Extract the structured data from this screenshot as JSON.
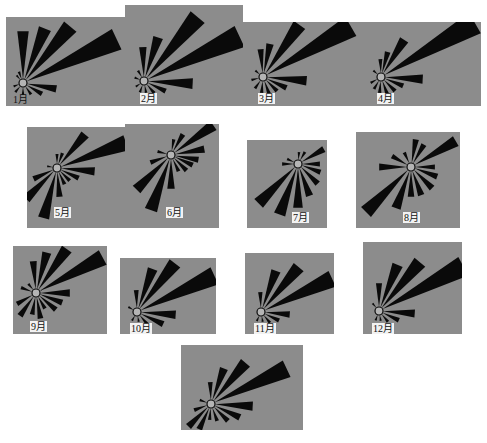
{
  "chart_data": {
    "type": "rose",
    "title": "",
    "panels": [
      {
        "label": "1月",
        "box": [
          6,
          17,
          119,
          89
        ],
        "hub": [
          23,
          83
        ],
        "label_pos": [
          12,
          94
        ],
        "label_box": false,
        "wedges": [
          [
            90,
            48
          ],
          [
            68,
            55
          ],
          [
            50,
            70
          ],
          [
            25,
            100
          ],
          [
            350,
            30
          ],
          [
            330,
            18
          ],
          [
            305,
            10
          ],
          [
            270,
            8
          ],
          [
            230,
            8
          ],
          [
            200,
            6
          ],
          [
            130,
            6
          ],
          [
            110,
            8
          ]
        ]
      },
      {
        "label": "2月",
        "box": [
          125,
          5,
          118,
          101
        ],
        "hub": [
          144,
          81
        ],
        "label_pos": [
          140,
          93
        ],
        "label_box": true,
        "wedges": [
          [
            92,
            30
          ],
          [
            72,
            42
          ],
          [
            50,
            80
          ],
          [
            25,
            102
          ],
          [
            357,
            45
          ],
          [
            335,
            20
          ],
          [
            310,
            12
          ],
          [
            280,
            8
          ],
          [
            250,
            8
          ],
          [
            215,
            6
          ],
          [
            160,
            6
          ],
          [
            120,
            8
          ]
        ]
      },
      {
        "label": "3月",
        "box": [
          243,
          22,
          123,
          84
        ],
        "hub": [
          263,
          77
        ],
        "label_pos": [
          258,
          93
        ],
        "label_box": true,
        "wedges": [
          [
            95,
            24
          ],
          [
            78,
            30
          ],
          [
            55,
            60
          ],
          [
            30,
            98
          ],
          [
            355,
            40
          ],
          [
            335,
            22
          ],
          [
            315,
            16
          ],
          [
            290,
            14
          ],
          [
            265,
            12
          ],
          [
            235,
            10
          ],
          [
            195,
            8
          ],
          [
            140,
            6
          ]
        ]
      },
      {
        "label": "4月",
        "box": [
          366,
          22,
          115,
          84
        ],
        "hub": [
          381,
          77
        ],
        "label_pos": [
          377,
          93
        ],
        "label_box": true,
        "wedges": [
          [
            92,
            14
          ],
          [
            75,
            22
          ],
          [
            58,
            40
          ],
          [
            30,
            105
          ],
          [
            357,
            38
          ],
          [
            338,
            20
          ],
          [
            315,
            16
          ],
          [
            290,
            14
          ],
          [
            265,
            12
          ],
          [
            240,
            10
          ],
          [
            210,
            8
          ],
          [
            140,
            6
          ]
        ]
      },
      {
        "label": "5月",
        "box": [
          27,
          127,
          98,
          101
        ],
        "hub": [
          57,
          168
        ],
        "label_pos": [
          54,
          207
        ],
        "label_box": true,
        "wedges": [
          [
            90,
            10
          ],
          [
            70,
            12
          ],
          [
            50,
            40
          ],
          [
            20,
            70
          ],
          [
            355,
            34
          ],
          [
            335,
            20
          ],
          [
            315,
            14
          ],
          [
            295,
            14
          ],
          [
            275,
            25
          ],
          [
            255,
            48
          ],
          [
            225,
            40
          ],
          [
            205,
            22
          ],
          [
            170,
            6
          ]
        ]
      },
      {
        "label": "6月",
        "box": [
          125,
          124,
          94,
          104
        ],
        "hub": [
          171,
          155
        ],
        "label_pos": [
          166,
          207
        ],
        "label_box": true,
        "wedges": [
          [
            80,
            12
          ],
          [
            60,
            20
          ],
          [
            35,
            48
          ],
          [
            10,
            30
          ],
          [
            350,
            24
          ],
          [
            335,
            20
          ],
          [
            315,
            18
          ],
          [
            295,
            14
          ],
          [
            270,
            30
          ],
          [
            250,
            55
          ],
          [
            225,
            45
          ],
          [
            200,
            18
          ],
          [
            165,
            10
          ]
        ]
      },
      {
        "label": "7月",
        "box": [
          247,
          140,
          80,
          88
        ],
        "hub": [
          298,
          164
        ],
        "label_pos": [
          292,
          212
        ],
        "label_box": true,
        "wedges": [
          [
            85,
            8
          ],
          [
            60,
            10
          ],
          [
            30,
            26
          ],
          [
            0,
            18
          ],
          [
            340,
            20
          ],
          [
            315,
            24
          ],
          [
            290,
            30
          ],
          [
            270,
            40
          ],
          [
            250,
            50
          ],
          [
            225,
            52
          ],
          [
            180,
            12
          ],
          [
            155,
            8
          ]
        ]
      },
      {
        "label": "8月",
        "box": [
          356,
          132,
          104,
          96
        ],
        "hub": [
          411,
          167
        ],
        "label_pos": [
          403,
          212
        ],
        "label_box": true,
        "wedges": [
          [
            80,
            24
          ],
          [
            60,
            22
          ],
          [
            30,
            48
          ],
          [
            0,
            20
          ],
          [
            340,
            24
          ],
          [
            315,
            26
          ],
          [
            290,
            26
          ],
          [
            270,
            26
          ],
          [
            250,
            40
          ],
          [
            225,
            60
          ],
          [
            180,
            28
          ],
          [
            150,
            18
          ],
          [
            115,
            12
          ]
        ]
      },
      {
        "label": "9月",
        "box": [
          13,
          246,
          94,
          88
        ],
        "hub": [
          36,
          293
        ],
        "label_pos": [
          30,
          321
        ],
        "label_box": true,
        "wedges": [
          [
            95,
            28
          ],
          [
            75,
            38
          ],
          [
            55,
            50
          ],
          [
            28,
            72
          ],
          [
            360,
            30
          ],
          [
            340,
            24
          ],
          [
            320,
            22
          ],
          [
            300,
            14
          ],
          [
            280,
            22
          ],
          [
            260,
            18
          ],
          [
            235,
            24
          ],
          [
            210,
            18
          ],
          [
            160,
            12
          ],
          [
            130,
            8
          ]
        ]
      },
      {
        "label": "10月",
        "box": [
          120,
          258,
          96,
          76
        ],
        "hub": [
          137,
          312
        ],
        "label_pos": [
          130,
          323
        ],
        "label_box": true,
        "wedges": [
          [
            92,
            18
          ],
          [
            70,
            42
          ],
          [
            52,
            58
          ],
          [
            25,
            82
          ],
          [
            356,
            35
          ],
          [
            335,
            25
          ],
          [
            310,
            12
          ],
          [
            280,
            6
          ],
          [
            240,
            6
          ],
          [
            150,
            6
          ]
        ]
      },
      {
        "label": "11月",
        "box": [
          245,
          253,
          89,
          81
        ],
        "hub": [
          261,
          312
        ],
        "label_pos": [
          254,
          323
        ],
        "label_box": true,
        "wedges": [
          [
            92,
            16
          ],
          [
            70,
            40
          ],
          [
            50,
            55
          ],
          [
            25,
            75
          ],
          [
            355,
            25
          ],
          [
            335,
            16
          ],
          [
            310,
            10
          ],
          [
            280,
            6
          ],
          [
            245,
            6
          ]
        ]
      },
      {
        "label": "12月",
        "box": [
          363,
          242,
          99,
          92
        ],
        "hub": [
          379,
          311
        ],
        "label_pos": [
          372,
          323
        ],
        "label_box": true,
        "wedges": [
          [
            90,
            24
          ],
          [
            68,
            46
          ],
          [
            50,
            60
          ],
          [
            28,
            92
          ],
          [
            356,
            32
          ],
          [
            335,
            18
          ],
          [
            310,
            10
          ],
          [
            280,
            6
          ],
          [
            250,
            6
          ],
          [
            130,
            6
          ]
        ]
      },
      {
        "label": "",
        "box": [
          181,
          345,
          122,
          85
        ],
        "hub": [
          211,
          404
        ],
        "label_pos": null,
        "label_box": false,
        "wedges": [
          [
            92,
            18
          ],
          [
            70,
            34
          ],
          [
            50,
            50
          ],
          [
            25,
            80
          ],
          [
            357,
            38
          ],
          [
            335,
            28
          ],
          [
            315,
            20
          ],
          [
            290,
            14
          ],
          [
            265,
            12
          ],
          [
            245,
            24
          ],
          [
            225,
            28
          ],
          [
            200,
            14
          ],
          [
            160,
            8
          ]
        ]
      }
    ],
    "hub_radius": 4,
    "wedge_width_factor": 0.11,
    "colors": {
      "panel": "#8c8c8c",
      "wedge": "#0a0a0a",
      "hub_fill": "#b4b4b4",
      "label_bg": "#f2f2f2"
    },
    "angle_convention": "degrees counter-clockwise from east (right)",
    "grid": false,
    "legend": null
  }
}
